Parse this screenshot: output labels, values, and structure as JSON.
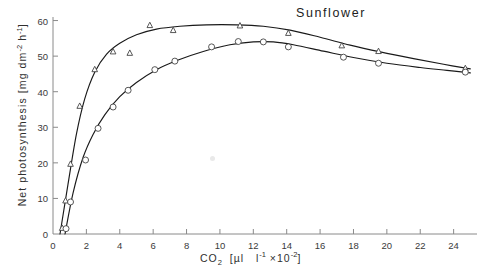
{
  "chart_data": {
    "type": "scatter",
    "title": "Sunflower",
    "xlabel": "CO2 [ul l-1 x10-2]",
    "xlabel_parts": {
      "species": "CO",
      "species_sub": "2",
      "open": "[",
      "unit1": "µl",
      "unit2": "l",
      "unit2_sup": "-1",
      "mult": "×10",
      "mult_sup": "-2",
      "close": "]"
    },
    "ylabel": "Net photosynthesis [mg dm-2 h-1]",
    "ylabel_parts": {
      "name": "Net photosynthesis",
      "open": "[",
      "unit1": "mg dm",
      "unit1_sup": "-2",
      "unit2": "h",
      "unit2_sup": "-1",
      "close": "]"
    },
    "xlim": [
      0,
      25.4
    ],
    "ylim": [
      0,
      61
    ],
    "xticks": [
      0,
      2,
      4,
      6,
      8,
      10,
      12,
      14,
      16,
      18,
      20,
      22,
      24
    ],
    "yticks": [
      0,
      10,
      20,
      30,
      40,
      50,
      60
    ],
    "xticklabels": [
      "0",
      "2",
      "4",
      "6",
      "8",
      "10",
      "12",
      "14",
      "16",
      "18",
      "20",
      "22",
      "24"
    ],
    "yticklabels": [
      "0",
      "10",
      "20",
      "30",
      "40",
      "50",
      "60"
    ],
    "grid": false,
    "legend": "none",
    "line_color": "#1a1a1a",
    "marker_color": "#444444",
    "axis_color": "#8a8a8a",
    "series": [
      {
        "name": "triangles",
        "marker": "triangle-up",
        "points": [
          {
            "x": 0.55,
            "y": 1.6
          },
          {
            "x": 0.75,
            "y": 9.3
          },
          {
            "x": 1.05,
            "y": 19.6
          },
          {
            "x": 1.6,
            "y": 35.9
          },
          {
            "x": 2.5,
            "y": 46.2
          },
          {
            "x": 3.6,
            "y": 51.2
          },
          {
            "x": 4.6,
            "y": 50.8
          },
          {
            "x": 5.8,
            "y": 58.6
          },
          {
            "x": 7.2,
            "y": 57.2
          },
          {
            "x": 11.2,
            "y": 58.5
          },
          {
            "x": 14.1,
            "y": 56.4
          },
          {
            "x": 17.3,
            "y": 52.9
          },
          {
            "x": 19.5,
            "y": 51.3
          },
          {
            "x": 24.7,
            "y": 46.5
          }
        ],
        "curve": [
          {
            "x": 0.42,
            "y": 0.0
          },
          {
            "x": 0.9,
            "y": 14.0
          },
          {
            "x": 1.4,
            "y": 28.0
          },
          {
            "x": 1.9,
            "y": 38.0
          },
          {
            "x": 2.5,
            "y": 45.5
          },
          {
            "x": 3.2,
            "y": 50.5
          },
          {
            "x": 4.0,
            "y": 53.6
          },
          {
            "x": 5.0,
            "y": 56.0
          },
          {
            "x": 6.2,
            "y": 57.6
          },
          {
            "x": 7.6,
            "y": 58.4
          },
          {
            "x": 9.2,
            "y": 58.8
          },
          {
            "x": 11.0,
            "y": 58.8
          },
          {
            "x": 12.6,
            "y": 58.4
          },
          {
            "x": 14.2,
            "y": 57.3
          },
          {
            "x": 16.0,
            "y": 55.3
          },
          {
            "x": 17.8,
            "y": 53.1
          },
          {
            "x": 19.6,
            "y": 51.2
          },
          {
            "x": 21.6,
            "y": 49.3
          },
          {
            "x": 23.4,
            "y": 47.7
          },
          {
            "x": 25.0,
            "y": 46.4
          }
        ]
      },
      {
        "name": "circles",
        "marker": "circle-open",
        "points": [
          {
            "x": 0.78,
            "y": 1.5
          },
          {
            "x": 1.05,
            "y": 9.0
          },
          {
            "x": 1.95,
            "y": 20.8
          },
          {
            "x": 2.7,
            "y": 29.7
          },
          {
            "x": 3.6,
            "y": 35.7
          },
          {
            "x": 4.5,
            "y": 40.4
          },
          {
            "x": 6.1,
            "y": 46.2
          },
          {
            "x": 7.3,
            "y": 48.6
          },
          {
            "x": 9.5,
            "y": 52.6
          },
          {
            "x": 11.1,
            "y": 54.1
          },
          {
            "x": 12.6,
            "y": 54.0
          },
          {
            "x": 14.1,
            "y": 52.6
          },
          {
            "x": 17.4,
            "y": 49.7
          },
          {
            "x": 19.5,
            "y": 48.0
          },
          {
            "x": 24.7,
            "y": 45.5
          }
        ],
        "curve": [
          {
            "x": 0.72,
            "y": 0.0
          },
          {
            "x": 1.2,
            "y": 11.5
          },
          {
            "x": 1.8,
            "y": 21.5
          },
          {
            "x": 2.4,
            "y": 28.0
          },
          {
            "x": 3.1,
            "y": 33.5
          },
          {
            "x": 4.0,
            "y": 38.6
          },
          {
            "x": 5.0,
            "y": 42.6
          },
          {
            "x": 6.2,
            "y": 46.2
          },
          {
            "x": 7.5,
            "y": 48.9
          },
          {
            "x": 9.0,
            "y": 51.3
          },
          {
            "x": 10.6,
            "y": 53.2
          },
          {
            "x": 12.0,
            "y": 54.0
          },
          {
            "x": 13.2,
            "y": 54.0
          },
          {
            "x": 14.4,
            "y": 53.2
          },
          {
            "x": 16.2,
            "y": 51.4
          },
          {
            "x": 18.0,
            "y": 49.6
          },
          {
            "x": 20.0,
            "y": 48.0
          },
          {
            "x": 22.0,
            "y": 46.8
          },
          {
            "x": 23.6,
            "y": 46.0
          },
          {
            "x": 25.0,
            "y": 45.3
          }
        ]
      }
    ]
  }
}
